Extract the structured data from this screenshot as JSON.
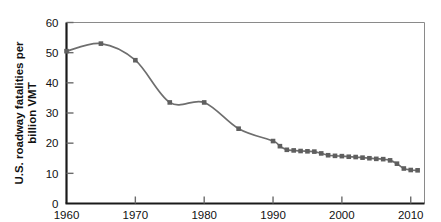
{
  "chart_data": {
    "type": "line",
    "title": "",
    "xlabel": "",
    "ylabel_line1": "U.S. roadway fatalities per",
    "ylabel_line2": "billion VMT",
    "ylabel": "U.S. roadway fatalities per billion VMT",
    "xlim": [
      1960,
      2012
    ],
    "ylim": [
      0,
      60
    ],
    "xticks": [
      1960,
      1970,
      1980,
      1990,
      2000,
      2010
    ],
    "xtick_labels": [
      "1960",
      "1970",
      "1980",
      "1990",
      "2000",
      "2010"
    ],
    "yticks": [
      0,
      10,
      20,
      30,
      40,
      50,
      60
    ],
    "ytick_labels": [
      "0",
      "10",
      "20",
      "30",
      "40",
      "50",
      "60"
    ],
    "grid": false,
    "legend": null,
    "marker": "square",
    "line_color": "#6e6e6e",
    "marker_color": "#5f5f5f",
    "axis_color": "#1a1a1a",
    "x": [
      1960,
      1965,
      1970,
      1975,
      1980,
      1985,
      1990,
      1991,
      1992,
      1993,
      1994,
      1995,
      1996,
      1997,
      1998,
      1999,
      2000,
      2001,
      2002,
      2003,
      2004,
      2005,
      2006,
      2007,
      2008,
      2009,
      2010,
      2011
    ],
    "values": [
      50.5,
      53.0,
      47.5,
      33.5,
      33.5,
      24.8,
      20.7,
      19.0,
      17.8,
      17.6,
      17.4,
      17.3,
      17.2,
      16.6,
      16.0,
      15.8,
      15.7,
      15.5,
      15.4,
      15.2,
      15.0,
      14.8,
      14.7,
      14.3,
      13.2,
      11.6,
      11.1,
      11.0
    ],
    "series": [
      {
        "name": "U.S. roadway fatalities per billion VMT",
        "x": [
          1960,
          1965,
          1970,
          1975,
          1980,
          1985,
          1990,
          1991,
          1992,
          1993,
          1994,
          1995,
          1996,
          1997,
          1998,
          1999,
          2000,
          2001,
          2002,
          2003,
          2004,
          2005,
          2006,
          2007,
          2008,
          2009,
          2010,
          2011
        ],
        "values": [
          50.5,
          53.0,
          47.5,
          33.5,
          33.5,
          24.8,
          20.7,
          19.0,
          17.8,
          17.6,
          17.4,
          17.3,
          17.2,
          16.6,
          16.0,
          15.8,
          15.7,
          15.5,
          15.4,
          15.2,
          15.0,
          14.8,
          14.7,
          14.3,
          13.2,
          11.6,
          11.1,
          11.0
        ]
      }
    ]
  }
}
